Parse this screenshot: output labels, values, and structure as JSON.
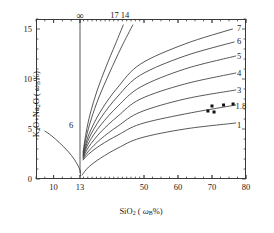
{
  "chart_data": {
    "type": "line",
    "title": "",
    "xlabel": "SiO2 ( ωB%)",
    "ylabel": "K2O+Na2O ( ωB%)",
    "xlim": [
      8,
      80
    ],
    "ylim": [
      0,
      16
    ],
    "xticks": [
      10,
      13,
      50,
      60,
      70,
      80
    ],
    "xtick_labels": [
      "10",
      "13",
      "50",
      "60",
      "70",
      "80"
    ],
    "yticks": [
      0,
      5,
      10,
      15
    ],
    "ytick_labels": [
      "0",
      "5",
      "10",
      "15"
    ],
    "x_minor_tick_step": 2,
    "y_minor_tick_step": 1,
    "grid": false,
    "legend": "inline-curve-end-labels",
    "axis_break_note": "x axis compressed between 13 and 50",
    "series": [
      {
        "name": "6",
        "label": "6",
        "label_x": 12.0,
        "label_y": 5.4,
        "points": [
          [
            9.0,
            4.8
          ],
          [
            9.8,
            4.3
          ],
          [
            10.7,
            3.6
          ],
          [
            11.6,
            2.8
          ],
          [
            12.4,
            1.9
          ],
          [
            13.0,
            0.9
          ],
          [
            13.2,
            0.35
          ]
        ]
      },
      {
        "name": "infinity",
        "label": "∞",
        "label_x": 13.0,
        "label_y": 16.3,
        "points": [
          [
            13.0,
            16.0
          ],
          [
            13.0,
            0.6
          ]
        ]
      },
      {
        "name": "17",
        "label": "17",
        "label_x": 33.0,
        "label_y": 16.4,
        "points": [
          [
            14.8,
            2.7
          ],
          [
            16.5,
            4.6
          ],
          [
            19.0,
            6.6
          ],
          [
            23.0,
            8.9
          ],
          [
            28.0,
            11.2
          ],
          [
            33.5,
            13.5
          ],
          [
            38.0,
            15.4
          ]
        ]
      },
      {
        "name": "14",
        "label": "14",
        "label_x": 39.0,
        "label_y": 16.4,
        "points": [
          [
            14.8,
            2.5
          ],
          [
            16.5,
            4.1
          ],
          [
            19.5,
            6.0
          ],
          [
            24.0,
            8.2
          ],
          [
            30.0,
            10.6
          ],
          [
            37.0,
            13.2
          ],
          [
            43.5,
            15.4
          ]
        ]
      },
      {
        "name": "7",
        "label": "7",
        "label_x": 78.0,
        "label_y": 15.1,
        "points": [
          [
            14.8,
            2.4
          ],
          [
            18.0,
            4.4
          ],
          [
            25.0,
            6.8
          ],
          [
            35.0,
            9.2
          ],
          [
            48.0,
            11.5
          ],
          [
            62.0,
            13.5
          ],
          [
            76.0,
            15.0
          ]
        ]
      },
      {
        "name": "6b",
        "label": "6",
        "label_x": 78.0,
        "label_y": 13.8,
        "points": [
          [
            14.8,
            2.3
          ],
          [
            18.0,
            4.0
          ],
          [
            25.0,
            6.1
          ],
          [
            35.0,
            8.3
          ],
          [
            48.0,
            10.4
          ],
          [
            62.0,
            12.3
          ],
          [
            76.5,
            13.7
          ]
        ]
      },
      {
        "name": "5",
        "label": "5",
        "label_x": 78.0,
        "label_y": 12.3,
        "points": [
          [
            14.8,
            2.2
          ],
          [
            18.0,
            3.6
          ],
          [
            25.0,
            5.4
          ],
          [
            35.0,
            7.3
          ],
          [
            48.0,
            9.2
          ],
          [
            62.0,
            11.0
          ],
          [
            77.0,
            12.3
          ]
        ]
      },
      {
        "name": "4",
        "label": "4",
        "label_x": 78.0,
        "label_y": 10.6,
        "points": [
          [
            14.8,
            2.1
          ],
          [
            18.0,
            3.2
          ],
          [
            25.0,
            4.7
          ],
          [
            35.0,
            6.3
          ],
          [
            48.0,
            8.0
          ],
          [
            62.0,
            9.5
          ],
          [
            77.0,
            10.6
          ]
        ]
      },
      {
        "name": "3",
        "label": "3",
        "label_x": 78.0,
        "label_y": 8.9,
        "points": [
          [
            14.8,
            2.0
          ],
          [
            18.0,
            2.8
          ],
          [
            25.0,
            4.0
          ],
          [
            35.0,
            5.3
          ],
          [
            48.0,
            6.7
          ],
          [
            62.0,
            8.0
          ],
          [
            77.0,
            8.9
          ]
        ]
      },
      {
        "name": "1.8",
        "label": "1.8",
        "label_x": 78.5,
        "label_y": 7.3,
        "points": [
          [
            14.8,
            1.9
          ],
          [
            18.0,
            2.5
          ],
          [
            25.0,
            3.4
          ],
          [
            35.0,
            4.4
          ],
          [
            48.0,
            5.5
          ],
          [
            62.0,
            6.5
          ],
          [
            77.0,
            7.4
          ]
        ]
      },
      {
        "name": "1",
        "label": "1",
        "label_x": 78.0,
        "label_y": 5.4,
        "points": [
          [
            14.2,
            0.4
          ],
          [
            18.0,
            1.2
          ],
          [
            25.0,
            2.1
          ],
          [
            35.0,
            3.1
          ],
          [
            48.0,
            4.1
          ],
          [
            62.0,
            5.0
          ],
          [
            77.0,
            5.6
          ]
        ]
      }
    ],
    "scatter": {
      "name": "measured-samples",
      "marker": "filled-square",
      "marker_color": "#111111",
      "points": [
        [
          68.8,
          6.8
        ],
        [
          70.0,
          7.3
        ],
        [
          70.6,
          6.7
        ],
        [
          73.4,
          7.4
        ],
        [
          76.2,
          7.5
        ]
      ]
    }
  }
}
